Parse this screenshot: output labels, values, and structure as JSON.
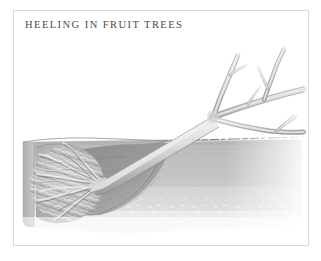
{
  "figure": {
    "caption": "HEELING IN FRUIT TREES",
    "frame_color": "#d9d9d9",
    "background_color": "#ffffff",
    "caption_color": "#4a4a4a"
  },
  "illustration": {
    "name": "heeled-in-fruit-tree-diagram",
    "description": "Grayscale botanical line illustration: a bare-root fruit tree laid at an angle into a shallow trench, its root ball buried in a cut-away block of soil at the left, with the trunk rising to the right into a branching crown.",
    "palette": {
      "soil_light": "#c9c9c9",
      "soil_mid": "#b4b4b4",
      "soil_dark": "#9a9a9a",
      "trench_fill": "#8f8f8f",
      "soil_face_shadow": "#a8a8a8",
      "ground_line": "#6f6f6f",
      "wood_light": "#e9e9e9",
      "wood_mid": "#c4c4c4",
      "wood_outline": "#7a7a7a",
      "root_light": "#dcdcdc",
      "root_dark": "#8a8a8a",
      "speckle": "#bcbcbc"
    },
    "parts": [
      {
        "name": "soil-block-cross-section",
        "label": "soil block"
      },
      {
        "name": "ground-surface-line",
        "label": "ground surface"
      },
      {
        "name": "trench-backfill",
        "label": "trench backfill"
      },
      {
        "name": "root-ball-mass",
        "label": "root ball"
      },
      {
        "name": "tree-trunk",
        "label": "trunk"
      },
      {
        "name": "tree-branches",
        "label": "branches"
      }
    ]
  }
}
